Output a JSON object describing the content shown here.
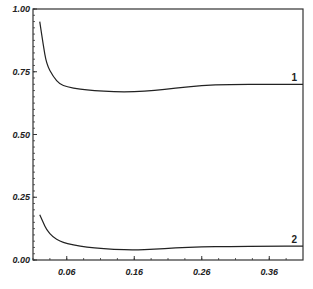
{
  "chart_data": {
    "type": "line",
    "title": "",
    "xlabel": "",
    "ylabel": "",
    "xlim": [
      0.01,
      0.41
    ],
    "ylim": [
      0.0,
      1.0
    ],
    "grid": false,
    "x_ticks": [
      "0.06",
      "0.16",
      "0.26",
      "0.36"
    ],
    "y_ticks": [
      "0.00",
      "0.25",
      "0.50",
      "0.75",
      "1.00"
    ],
    "series": [
      {
        "name": "1",
        "x": [
          0.02,
          0.025,
          0.03,
          0.04,
          0.05,
          0.06,
          0.08,
          0.1,
          0.13,
          0.16,
          0.19,
          0.22,
          0.26,
          0.3,
          0.36,
          0.41
        ],
        "y": [
          0.95,
          0.86,
          0.78,
          0.73,
          0.7,
          0.69,
          0.68,
          0.675,
          0.67,
          0.67,
          0.675,
          0.685,
          0.695,
          0.7,
          0.7,
          0.7
        ]
      },
      {
        "name": "2",
        "x": [
          0.02,
          0.025,
          0.03,
          0.04,
          0.05,
          0.06,
          0.08,
          0.1,
          0.13,
          0.16,
          0.19,
          0.22,
          0.26,
          0.3,
          0.36,
          0.41
        ],
        "y": [
          0.18,
          0.15,
          0.12,
          0.09,
          0.075,
          0.065,
          0.055,
          0.048,
          0.042,
          0.04,
          0.043,
          0.048,
          0.052,
          0.054,
          0.055,
          0.055
        ]
      }
    ],
    "annotations": [
      {
        "text": "1",
        "x": 0.4,
        "y": 0.72
      },
      {
        "text": "2",
        "x": 0.4,
        "y": 0.075
      }
    ]
  }
}
